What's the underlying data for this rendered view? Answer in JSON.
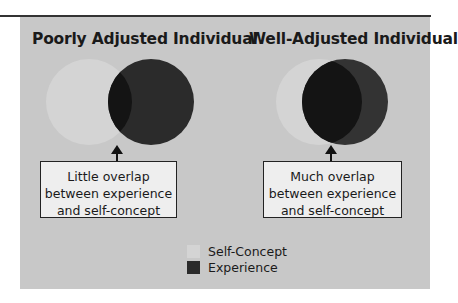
{
  "diagram": {
    "left": {
      "title": "Poorly Adjusted Individual",
      "caption_lines": [
        "Little overlap",
        "between experience",
        "and self-concept"
      ]
    },
    "right": {
      "title": "Well-Adjusted Individual",
      "caption_lines": [
        "Much overlap",
        "between experience",
        "and self-concept"
      ]
    },
    "legend": [
      {
        "label": "Self-Concept",
        "color": "#d4d4d4"
      },
      {
        "label": "Experience",
        "color": "#2b2b2b"
      }
    ],
    "colors": {
      "panel": "#c8c8c8",
      "self_concept": "#d4d4d4",
      "experience": "#2b2b2b",
      "overlap": "#141414"
    }
  }
}
